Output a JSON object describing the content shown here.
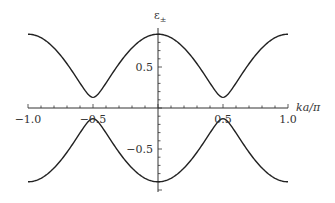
{
  "chart_data": {
    "type": "line",
    "title": "",
    "xlabel": "ka/π",
    "ylabel": "ε±",
    "xlim": [
      -1.0,
      1.0
    ],
    "ylim": [
      -1.0,
      1.0
    ],
    "grid": false,
    "legend": null,
    "x_ticks": [
      "-1.0",
      "-0.5",
      "0.5",
      "1.0"
    ],
    "y_ticks": [
      "0.5",
      "-0.5"
    ],
    "series": [
      {
        "name": "ε+",
        "x": [
          -1.0,
          -0.75,
          -0.5,
          -0.25,
          0.0,
          0.25,
          0.5,
          0.75,
          1.0
        ],
        "values": [
          0.9,
          0.65,
          0.13,
          0.65,
          0.9,
          0.65,
          0.13,
          0.65,
          0.9
        ]
      },
      {
        "name": "ε-",
        "x": [
          -1.0,
          -0.75,
          -0.5,
          -0.25,
          0.0,
          0.25,
          0.5,
          0.75,
          1.0
        ],
        "values": [
          -0.9,
          -0.65,
          -0.13,
          -0.65,
          -0.9,
          -0.65,
          -0.13,
          -0.65,
          -0.9
        ]
      }
    ],
    "model": {
      "max": 0.9,
      "min": 0.13
    }
  },
  "labels": {
    "xlabel": "ka/π",
    "ylabel_main": "ε",
    "ylabel_sub": "±",
    "xt0": "−1.0",
    "xt1": "−0.5",
    "xt2": "0.5",
    "xt3": "1.0",
    "yt0": "0.5",
    "yt1": "−0.5"
  }
}
